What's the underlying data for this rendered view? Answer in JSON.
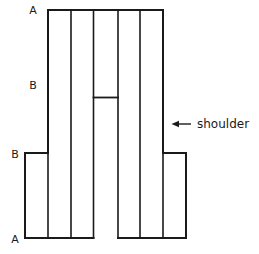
{
  "figure": {
    "title": "Cross-section diagram with shoulder",
    "background_color": "#ffffff",
    "line_color": "#1a1a1a",
    "canvas": {
      "width": 259,
      "height": 254
    },
    "geometry": {
      "top_y": 10,
      "shoulder_y": 153,
      "bottom_y": 238,
      "crossbar_y": 97.5,
      "core_left_x": 48,
      "core_right_x": 163,
      "shoulder_left_x": 25,
      "shoulder_right_x": 186,
      "gap_left_x": 93.5,
      "gap_right_x": 118,
      "column_lines_x": [
        48,
        71,
        93.5,
        118,
        140,
        163
      ],
      "column_count": 5
    },
    "outline_path": "M 25,238 L 25,153 L 48,153 L 48,10 L 163,10 L 163,153 L 186,153 L 186,238 L 118,238 M 93.5,238 L 25,238",
    "divider_lines": [
      {
        "name": "column-divider-1",
        "x": 71,
        "y1": 10,
        "y2": 238
      },
      {
        "name": "column-divider-2",
        "x": 93.5,
        "y1": 10,
        "y2": 238
      },
      {
        "name": "column-divider-3",
        "x": 118,
        "y1": 10,
        "y2": 238
      },
      {
        "name": "column-divider-4",
        "x": 140,
        "y1": 10,
        "y2": 238
      },
      {
        "name": "core-left-edge",
        "x": 48,
        "y1": 10,
        "y2": 238
      },
      {
        "name": "core-right-edge",
        "x": 163,
        "y1": 10,
        "y2": 238
      }
    ],
    "crossbar": {
      "name": "center-crossbar",
      "x1": 93.5,
      "x2": 118,
      "y": 97.5
    },
    "labels": [
      {
        "id": "label-a-top",
        "text": "A",
        "x": 33,
        "y": 14,
        "anchor": "middle"
      },
      {
        "id": "label-b-upper",
        "text": "B",
        "x": 33,
        "y": 89,
        "anchor": "middle"
      },
      {
        "id": "label-b-lower",
        "text": "B",
        "x": 15,
        "y": 158,
        "anchor": "middle"
      },
      {
        "id": "label-a-bottom",
        "text": "A",
        "x": 15,
        "y": 243,
        "anchor": "middle"
      }
    ],
    "annotation": {
      "id": "shoulder-annotation",
      "text": "shoulder",
      "text_x": 197,
      "text_y": 128,
      "arrow": {
        "tail_x": 191,
        "head_x": 172,
        "y": 124,
        "direction": "left"
      }
    }
  }
}
